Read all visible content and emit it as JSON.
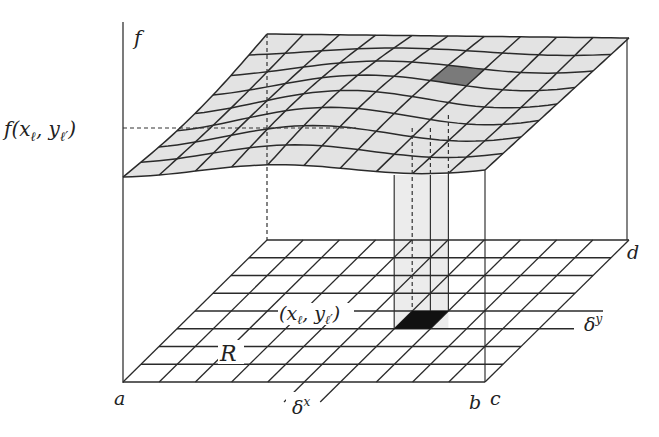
{
  "figure": {
    "colors": {
      "surface_fill": "#e3e3e3",
      "highlight_surface_cell": "#7a7a7a",
      "highlight_domain_cell": "#111111",
      "column_fill": "#ececec",
      "line": "#2a2a2a"
    },
    "grid": {
      "columns": 10,
      "rows": 8
    }
  },
  "labels": {
    "f_axis": "f",
    "f_value_base": "f(x",
    "f_value_sub_x": "ℓ",
    "f_value_mid": ", y",
    "f_value_sub_y": "ℓ′",
    "f_value_end": ")",
    "point_open": "(x",
    "point_sub_x": "ℓ",
    "point_mid": ", y",
    "point_sub_y": "ℓ′",
    "point_close": ")",
    "region": "R",
    "a": "a",
    "b": "b",
    "c": "c",
    "d": "d",
    "delta_x": "δ",
    "delta_x_sup": "x",
    "delta_y": "δ",
    "delta_y_sup": "y"
  }
}
